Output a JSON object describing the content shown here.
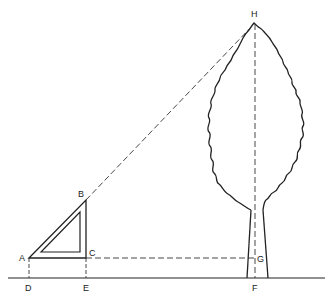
{
  "diagram": {
    "type": "geometry-height-measurement",
    "labels": {
      "A": "A",
      "B": "B",
      "C": "C",
      "D": "D",
      "E": "E",
      "F": "F",
      "G": "G",
      "H": "H"
    },
    "stroke_color": "#222222",
    "background": "#ffffff"
  }
}
